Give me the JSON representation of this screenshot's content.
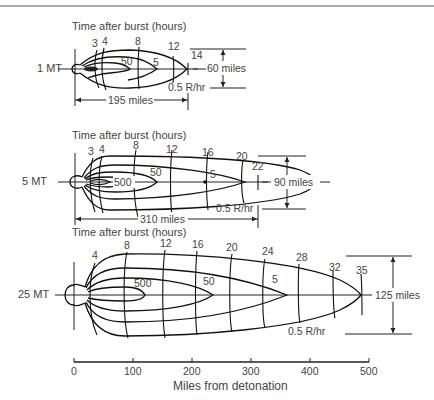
{
  "figure": {
    "type": "fallout-pattern-diagram",
    "x_axis": {
      "label": "Miles from detonation",
      "ticks": [
        "0",
        "100",
        "200",
        "300",
        "400",
        "500"
      ]
    },
    "panels": [
      {
        "yield": "1 MT",
        "title": "Time after burst (hours)",
        "time_labels": [
          "3",
          "4",
          "8",
          "12",
          "14"
        ],
        "contour_labels": [
          "50",
          "5",
          "0.5 R/hr"
        ],
        "length_label": "195 miles",
        "width_label": "60 miles"
      },
      {
        "yield": "5 MT",
        "title": "Time after burst (hours)",
        "time_labels": [
          "3",
          "4",
          "8",
          "12",
          "16",
          "20",
          "22"
        ],
        "contour_labels": [
          "500",
          "50",
          "5",
          "0.5 R/hr"
        ],
        "length_label": "310 miles",
        "width_label": "90 miles"
      },
      {
        "yield": "25 MT",
        "title": "Time after burst (hours)",
        "time_labels": [
          "4",
          "8",
          "12",
          "16",
          "20",
          "24",
          "28",
          "32",
          "35"
        ],
        "contour_labels": [
          "500",
          "50",
          "5",
          "0.5 R/hr"
        ],
        "length_label": null,
        "width_label": "125 miles"
      }
    ]
  }
}
